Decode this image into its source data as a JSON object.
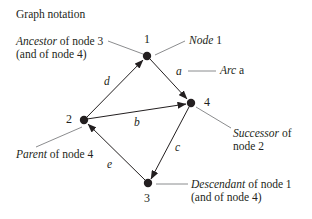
{
  "title": "Graph notation",
  "nodes": [
    {
      "id": "1",
      "label": "1"
    },
    {
      "id": "2",
      "label": "2"
    },
    {
      "id": "3",
      "label": "3"
    },
    {
      "id": "4",
      "label": "4"
    }
  ],
  "arcs": [
    {
      "label": "a",
      "from": "1",
      "to": "4"
    },
    {
      "label": "b",
      "from": "2",
      "to": "4"
    },
    {
      "label": "c",
      "from": "4",
      "to": "3"
    },
    {
      "label": "d",
      "from": "2",
      "to": "1"
    },
    {
      "label": "e",
      "from": "3",
      "to": "2"
    }
  ],
  "annotations": {
    "ancestor": {
      "term": "Ancestor",
      "rest": " of node 3",
      "line2": "(and of node 4)"
    },
    "node1": {
      "term": "Node",
      "rest": " 1"
    },
    "arc_a": {
      "term": "Arc",
      "rest": " a"
    },
    "successor": {
      "term": "Successor",
      "rest": " of",
      "line2": "node 2"
    },
    "parent": {
      "term": "Parent",
      "rest": " of node 4"
    },
    "descendant": {
      "term": "Descendant",
      "rest": " of node 1",
      "line2": "(and of node 4)"
    }
  },
  "colors": {
    "ink": "#231f20",
    "leader": "#6d6e71",
    "background": "#ffffff"
  }
}
